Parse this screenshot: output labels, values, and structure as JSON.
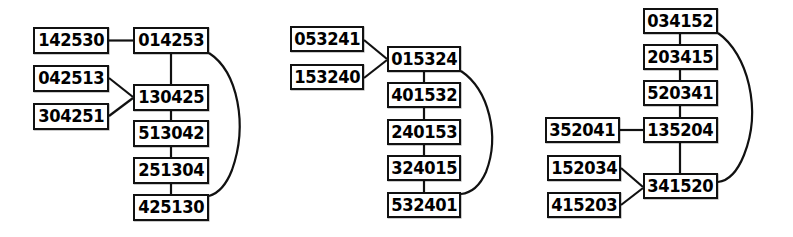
{
  "diagram": {
    "background_color": "#ffffff",
    "node_fill": "#ffffff",
    "node_stroke": "#111111",
    "edge_color": "#111111",
    "clusters": [
      {
        "id": "cluster-1",
        "nodes": [
          {
            "id": "c1-n1",
            "label": "142530",
            "x": 33,
            "y": 27,
            "w": 76,
            "h": 27
          },
          {
            "id": "c1-n2",
            "label": "014253",
            "x": 133,
            "y": 27,
            "w": 76,
            "h": 27
          },
          {
            "id": "c1-n3",
            "label": "042513",
            "x": 33,
            "y": 65,
            "w": 76,
            "h": 27
          },
          {
            "id": "c1-n4",
            "label": "304251",
            "x": 33,
            "y": 103,
            "w": 76,
            "h": 27
          },
          {
            "id": "c1-n5",
            "label": "130425",
            "x": 133,
            "y": 84,
            "w": 76,
            "h": 27
          },
          {
            "id": "c1-n6",
            "label": "513042",
            "x": 133,
            "y": 120,
            "w": 76,
            "h": 27
          },
          {
            "id": "c1-n7",
            "label": "251304",
            "x": 133,
            "y": 157,
            "w": 76,
            "h": 27
          },
          {
            "id": "c1-n8",
            "label": "425130",
            "x": 133,
            "y": 194,
            "w": 76,
            "h": 27
          }
        ],
        "edges": [
          {
            "from": "142530",
            "to": "014253",
            "kind": "straight"
          },
          {
            "from": "014253",
            "to": "130425",
            "kind": "straight"
          },
          {
            "from": "042513",
            "to": "130425",
            "kind": "straight"
          },
          {
            "from": "304251",
            "to": "130425",
            "kind": "straight"
          },
          {
            "from": "130425",
            "to": "513042",
            "kind": "straight"
          },
          {
            "from": "513042",
            "to": "251304",
            "kind": "straight"
          },
          {
            "from": "251304",
            "to": "425130",
            "kind": "straight"
          },
          {
            "from": "014253",
            "to": "425130",
            "kind": "curved-right"
          }
        ]
      },
      {
        "id": "cluster-2",
        "nodes": [
          {
            "id": "c2-n1",
            "label": "053241",
            "x": 290,
            "y": 26,
            "w": 74,
            "h": 26
          },
          {
            "id": "c2-n2",
            "label": "153240",
            "x": 290,
            "y": 64,
            "w": 74,
            "h": 26
          },
          {
            "id": "c2-n3",
            "label": "015324",
            "x": 387,
            "y": 46,
            "w": 74,
            "h": 26
          },
          {
            "id": "c2-n4",
            "label": "401532",
            "x": 387,
            "y": 82,
            "w": 74,
            "h": 26
          },
          {
            "id": "c2-n5",
            "label": "240153",
            "x": 387,
            "y": 119,
            "w": 74,
            "h": 26
          },
          {
            "id": "c2-n6",
            "label": "324015",
            "x": 387,
            "y": 155,
            "w": 74,
            "h": 26
          },
          {
            "id": "c2-n7",
            "label": "532401",
            "x": 387,
            "y": 192,
            "w": 74,
            "h": 26
          }
        ],
        "edges": [
          {
            "from": "053241",
            "to": "015324",
            "kind": "straight"
          },
          {
            "from": "153240",
            "to": "015324",
            "kind": "straight"
          },
          {
            "from": "015324",
            "to": "401532",
            "kind": "straight"
          },
          {
            "from": "401532",
            "to": "240153",
            "kind": "straight"
          },
          {
            "from": "240153",
            "to": "324015",
            "kind": "straight"
          },
          {
            "from": "324015",
            "to": "532401",
            "kind": "straight"
          },
          {
            "from": "015324",
            "to": "532401",
            "kind": "curved-right"
          }
        ]
      },
      {
        "id": "cluster-3",
        "nodes": [
          {
            "id": "c3-n1",
            "label": "034152",
            "x": 643,
            "y": 8,
            "w": 75,
            "h": 26
          },
          {
            "id": "c3-n2",
            "label": "203415",
            "x": 643,
            "y": 44,
            "w": 75,
            "h": 26
          },
          {
            "id": "c3-n3",
            "label": "520341",
            "x": 643,
            "y": 80,
            "w": 75,
            "h": 26
          },
          {
            "id": "c3-n4",
            "label": "135204",
            "x": 643,
            "y": 117,
            "w": 75,
            "h": 26
          },
          {
            "id": "c3-n5",
            "label": "341520",
            "x": 643,
            "y": 173,
            "w": 75,
            "h": 26
          },
          {
            "id": "c3-n6",
            "label": "352041",
            "x": 545,
            "y": 117,
            "w": 75,
            "h": 26
          },
          {
            "id": "c3-n7",
            "label": "152034",
            "x": 547,
            "y": 155,
            "w": 74,
            "h": 26
          },
          {
            "id": "c3-n8",
            "label": "415203",
            "x": 547,
            "y": 192,
            "w": 74,
            "h": 26
          }
        ],
        "edges": [
          {
            "from": "034152",
            "to": "203415",
            "kind": "straight"
          },
          {
            "from": "203415",
            "to": "520341",
            "kind": "straight"
          },
          {
            "from": "520341",
            "to": "135204",
            "kind": "straight"
          },
          {
            "from": "352041",
            "to": "135204",
            "kind": "straight"
          },
          {
            "from": "135204",
            "to": "341520",
            "kind": "straight"
          },
          {
            "from": "152034",
            "to": "341520",
            "kind": "straight"
          },
          {
            "from": "415203",
            "to": "341520",
            "kind": "straight"
          },
          {
            "from": "034152",
            "to": "341520",
            "kind": "curved-right"
          }
        ]
      }
    ]
  }
}
